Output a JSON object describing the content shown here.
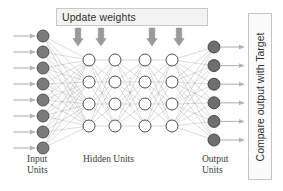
{
  "figure": {
    "type": "diagram"
  },
  "update_box": {
    "label": "Update weights",
    "arrow_count": 4,
    "arrow_color": "#9a9a9a",
    "box_fill": "#f3f3f3",
    "box_border": "#c9c9c9"
  },
  "compare_box": {
    "label": "Compare output  with Target",
    "orientation": "vertical-bottom-to-top",
    "box_fill": "#fbfbfb",
    "box_border": "#c4c4c4"
  },
  "captions": {
    "input": "Input\nUnits",
    "hidden": "Hidden Units",
    "output": "Output\nUnits"
  },
  "layers": [
    {
      "name": "input",
      "node_count": 8,
      "node_fill": "#7b7b7b",
      "node_stroke": "#4a4a4a",
      "node_radius": 6,
      "x": 43,
      "y_start": 36,
      "y_step": 16,
      "has_incoming_arrows": true
    },
    {
      "name": "hidden-1",
      "node_count": 4,
      "node_fill": "#ffffff",
      "node_stroke": "#3b3b3b",
      "node_radius": 6,
      "x": 89,
      "y_start": 60,
      "y_step": 22
    },
    {
      "name": "hidden-2",
      "node_count": 4,
      "node_fill": "#ffffff",
      "node_stroke": "#3b3b3b",
      "node_radius": 6,
      "x": 115,
      "y_start": 60,
      "y_step": 22
    },
    {
      "name": "hidden-3",
      "node_count": 4,
      "node_fill": "#ffffff",
      "node_stroke": "#3b3b3b",
      "node_radius": 6,
      "x": 145,
      "y_start": 60,
      "y_step": 22
    },
    {
      "name": "hidden-4",
      "node_count": 4,
      "node_fill": "#ffffff",
      "node_stroke": "#3b3b3b",
      "node_radius": 6,
      "x": 172,
      "y_start": 60,
      "y_step": 22
    },
    {
      "name": "output",
      "node_count": 6,
      "node_fill": "#6f6f6f",
      "node_stroke": "#3f3f3f",
      "node_radius": 6,
      "x": 214,
      "y_start": 47,
      "y_step": 18.6,
      "has_outgoing_arrows": true
    }
  ],
  "ellipsis": [
    {
      "name": "input-ellipsis",
      "x": 52,
      "y_start": 84,
      "dots": 4
    },
    {
      "name": "hidden-ellipsis",
      "x": 130,
      "y_start": 78,
      "dots": 5
    }
  ],
  "edge_color": "#a5a5a5",
  "io_arrow_color": "#b3b3b3"
}
